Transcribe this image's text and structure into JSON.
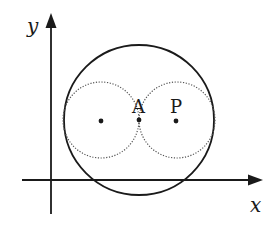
{
  "diagram": {
    "axes": {
      "x_label": "x",
      "y_label": "y"
    },
    "points": {
      "A": {
        "label": "A"
      },
      "P": {
        "label": "P"
      }
    },
    "circles": {
      "large": {
        "style": "solid"
      },
      "small_left": {
        "style": "dotted"
      },
      "small_right": {
        "style": "dotted"
      }
    },
    "colors": {
      "stroke": "#1a1a1a",
      "background": "#ffffff"
    }
  }
}
